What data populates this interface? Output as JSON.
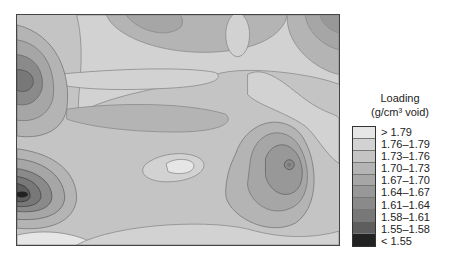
{
  "chart_data": {
    "type": "heatmap",
    "subtype": "filled-contour",
    "title": "",
    "xlabel": "",
    "ylabel": "",
    "legend": {
      "title_line1": "Loading",
      "title_line2": "(g/cm³ void)",
      "position": "right",
      "bins": [
        {
          "label": "> 1.79",
          "min": 1.79,
          "max": null,
          "color": "#e6e6e6"
        },
        {
          "label": "1.76–1.79",
          "min": 1.76,
          "max": 1.79,
          "color": "#d2d2d2"
        },
        {
          "label": "1.73–1.76",
          "min": 1.73,
          "max": 1.76,
          "color": "#c4c4c4"
        },
        {
          "label": "1.70–1.73",
          "min": 1.7,
          "max": 1.73,
          "color": "#b4b4b4"
        },
        {
          "label": "1.67–1.70",
          "min": 1.67,
          "max": 1.7,
          "color": "#a6a6a6"
        },
        {
          "label": "1.64–1.67",
          "min": 1.64,
          "max": 1.67,
          "color": "#989898"
        },
        {
          "label": "1.61–1.64",
          "min": 1.61,
          "max": 1.64,
          "color": "#8a8a8a"
        },
        {
          "label": "1.58–1.61",
          "min": 1.58,
          "max": 1.61,
          "color": "#787878"
        },
        {
          "label": "1.55–1.58",
          "min": 1.55,
          "max": 1.58,
          "color": "#5e5e5e"
        },
        {
          "label": "< 1.55",
          "min": null,
          "max": 1.55,
          "color": "#222222"
        }
      ]
    },
    "features": [
      {
        "type": "minimum",
        "location": "left edge, upper (x≈0.03, y≈0.35)",
        "lowest_bin": "1.58–1.61"
      },
      {
        "type": "minimum",
        "location": "left edge, lower (x≈0.03, y≈0.79)",
        "lowest_bin": "< 1.55"
      },
      {
        "type": "minimum",
        "location": "right-center (x≈0.84, y≈0.47)",
        "lowest_bin": "1.64–1.67"
      },
      {
        "type": "maximum",
        "location": "center (x≈0.55, y≈0.5)",
        "highest_bin": "> 1.79"
      },
      {
        "type": "maximum",
        "location": "upper-left-center band (x≈0.25, y≈0.2)",
        "highest_bin": "1.76–1.79"
      }
    ],
    "grid": false,
    "axes_ticks": false
  }
}
